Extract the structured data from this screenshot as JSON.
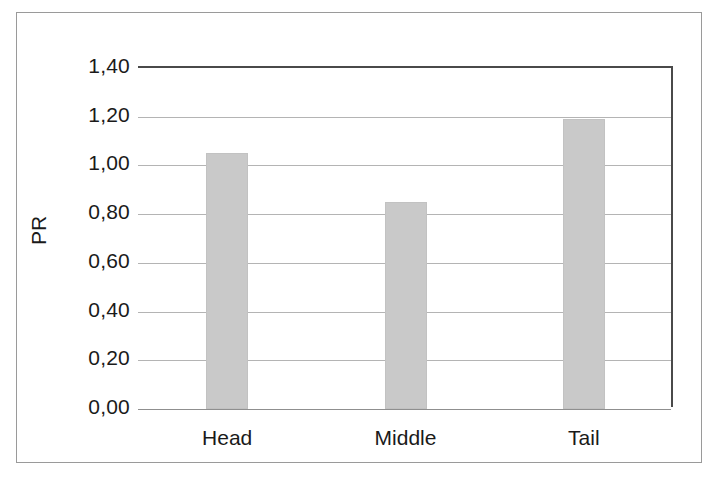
{
  "chart_data": {
    "type": "bar",
    "title": "",
    "xlabel": "",
    "ylabel": "PR",
    "categories": [
      "Head",
      "Middle",
      "Tail"
    ],
    "values": [
      1.05,
      0.85,
      1.19
    ],
    "value_labels": [
      "1,05",
      "0,85",
      "1,19"
    ],
    "ylim": [
      0,
      1.4
    ],
    "ytick_values": [
      0,
      0.2,
      0.4,
      0.6,
      0.8,
      1.0,
      1.2,
      1.4
    ],
    "ytick_labels": [
      "0,00",
      "0,20",
      "0,40",
      "0,60",
      "0,80",
      "1,00",
      "1,20",
      "1,40"
    ],
    "decimal_separator": ",",
    "grid": "horizontal",
    "legend": "none",
    "bar_color": "#c9c9c9",
    "gridline_color": "#b4b4b4",
    "axis_color": "#4a4a4a",
    "series": [
      {
        "name": "PR",
        "values": [
          1.05,
          0.85,
          1.19
        ]
      }
    ]
  }
}
